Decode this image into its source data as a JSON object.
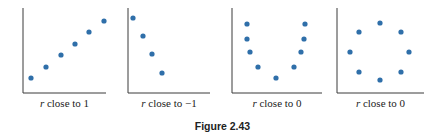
{
  "figure_title": "Figure 2.43",
  "colors": {
    "dot": "#2f6fa9",
    "axis": "#3a3a3a"
  },
  "chart_data": [
    {
      "type": "scatter",
      "caption_var": "r",
      "caption": " close to 1",
      "axis": {
        "x0": 23,
        "y_top": 8,
        "y_axis": 93,
        "x1": 106
      },
      "points": [
        [
          31,
          78
        ],
        [
          46,
          67
        ],
        [
          61,
          55
        ],
        [
          75,
          44
        ],
        [
          89,
          32
        ],
        [
          104,
          21
        ]
      ],
      "description": "strong positive linear"
    },
    {
      "type": "scatter",
      "caption_var": "r",
      "caption": " close to −1",
      "axis": {
        "x0": 128,
        "y_top": 8,
        "y_axis": 93,
        "x1": 210
      },
      "points": [
        [
          133,
          18
        ],
        [
          143,
          36
        ],
        [
          152,
          54
        ],
        [
          162,
          73
        ]
      ],
      "description": "strong negative linear"
    },
    {
      "type": "scatter",
      "caption_var": "r",
      "caption": " close to 0",
      "axis": {
        "x0": 232,
        "y_top": 8,
        "y_axis": 93,
        "x1": 322
      },
      "points": [
        [
          247,
          24
        ],
        [
          247,
          39
        ],
        [
          250,
          52
        ],
        [
          258,
          67
        ],
        [
          276,
          78
        ],
        [
          294,
          67
        ],
        [
          301,
          52
        ],
        [
          304,
          39
        ],
        [
          305,
          24
        ]
      ],
      "description": "U-shaped (nonlinear)"
    },
    {
      "type": "scatter",
      "caption_var": "r",
      "caption": " close to 0",
      "axis": {
        "x0": 337,
        "y_top": 8,
        "y_axis": 93,
        "x1": 424
      },
      "points": [
        [
          380,
          23
        ],
        [
          359,
          32
        ],
        [
          401,
          32
        ],
        [
          350,
          52
        ],
        [
          409,
          52
        ],
        [
          359,
          72
        ],
        [
          401,
          72
        ],
        [
          380,
          80
        ]
      ],
      "description": "circular (nonlinear)"
    }
  ]
}
